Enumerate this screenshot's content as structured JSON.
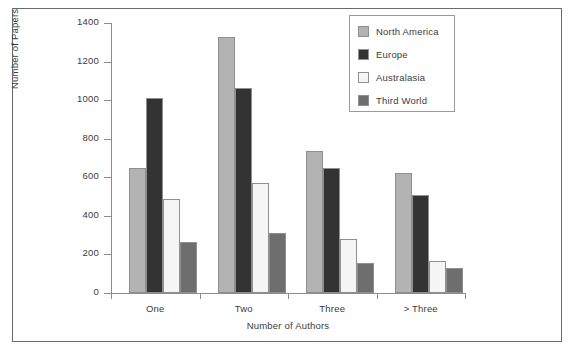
{
  "chart_data": {
    "type": "bar",
    "title": "",
    "xlabel": "Number of Authors",
    "ylabel": "Number of Papers",
    "categories": [
      "One",
      "Two",
      "Three",
      "> Three"
    ],
    "series": [
      {
        "name": "North America",
        "color": "#b3b3b3",
        "values": [
          650,
          1330,
          735,
          620
        ]
      },
      {
        "name": "Europe",
        "color": "#333333",
        "values": [
          1010,
          1065,
          650,
          510
        ]
      },
      {
        "name": "Australasia",
        "color": "#f5f5f5",
        "values": [
          490,
          570,
          280,
          165
        ]
      },
      {
        "name": "Third World",
        "color": "#6e6e6e",
        "values": [
          265,
          310,
          155,
          130
        ]
      }
    ],
    "ylim": [
      0,
      1400
    ],
    "ytick_values": [
      0,
      200,
      400,
      600,
      800,
      1000,
      1200,
      1400
    ],
    "ytick_labels": [
      "0",
      "200",
      "400",
      "600",
      "800",
      "1000",
      "1200",
      "1400"
    ],
    "grid": false,
    "legend_position": "top-right",
    "legend_entries": [
      "North America",
      "Europe",
      "Australasia",
      "Third World"
    ]
  },
  "figure": {
    "caption": ""
  }
}
